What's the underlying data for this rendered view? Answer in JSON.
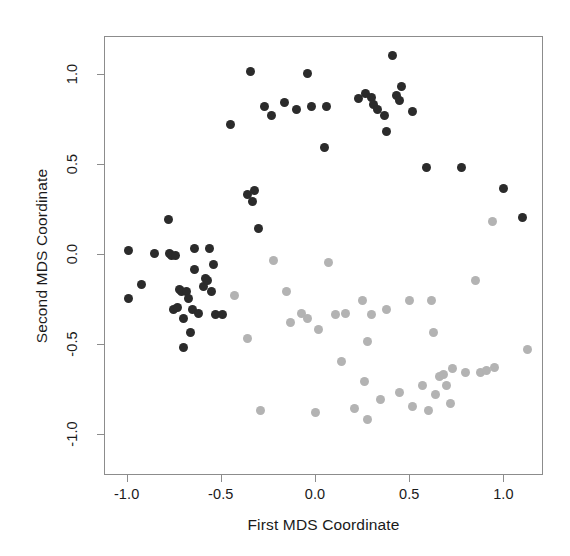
{
  "chart_data": {
    "type": "scatter",
    "title": "",
    "xlabel": "First MDS Coordinate",
    "ylabel": "Second MDS Coordinate",
    "xlim": [
      -1.12,
      1.21
    ],
    "ylim": [
      -1.23,
      1.21
    ],
    "xticks": [
      -1.0,
      -0.5,
      0.0,
      0.5,
      1.0
    ],
    "xticklabels": [
      "-1.0",
      "-0.5",
      "0.0",
      "0.5",
      "1.0"
    ],
    "yticks": [
      -1.0,
      -0.5,
      0.0,
      0.5,
      1.0
    ],
    "yticklabels": [
      "-1.0",
      "-0.5",
      "0.0",
      "0.5",
      "1.0"
    ],
    "grid": false,
    "legend": "none",
    "marker": "filled-circle",
    "marker_size_px": 9,
    "series": [
      {
        "name": "group-dark",
        "color": "#2b2b2b",
        "points": [
          [
            -0.99,
            0.02
          ],
          [
            -0.99,
            -0.25
          ],
          [
            -0.92,
            -0.17
          ],
          [
            -0.85,
            0.0
          ],
          [
            -0.78,
            0.19
          ],
          [
            -0.77,
            0.0
          ],
          [
            -0.76,
            -0.01
          ],
          [
            -0.75,
            -0.31
          ],
          [
            -0.74,
            -0.01
          ],
          [
            -0.73,
            -0.3
          ],
          [
            -0.72,
            -0.2
          ],
          [
            -0.71,
            -0.21
          ],
          [
            -0.7,
            -0.36
          ],
          [
            -0.7,
            -0.52
          ],
          [
            -0.68,
            -0.21
          ],
          [
            -0.67,
            -0.25
          ],
          [
            -0.66,
            -0.44
          ],
          [
            -0.65,
            -0.31
          ],
          [
            -0.64,
            -0.09
          ],
          [
            -0.64,
            0.03
          ],
          [
            -0.62,
            -0.33
          ],
          [
            -0.59,
            -0.18
          ],
          [
            -0.58,
            -0.14
          ],
          [
            -0.57,
            -0.15
          ],
          [
            -0.56,
            0.03
          ],
          [
            -0.55,
            -0.21
          ],
          [
            -0.54,
            -0.06
          ],
          [
            -0.53,
            -0.34
          ],
          [
            -0.49,
            -0.34
          ],
          [
            -0.45,
            0.72
          ],
          [
            -0.36,
            0.33
          ],
          [
            -0.34,
            1.01
          ],
          [
            -0.33,
            0.29
          ],
          [
            -0.32,
            0.35
          ],
          [
            -0.3,
            0.14
          ],
          [
            -0.27,
            0.82
          ],
          [
            -0.23,
            0.77
          ],
          [
            -0.16,
            0.84
          ],
          [
            -0.1,
            0.8
          ],
          [
            -0.04,
            1.0
          ],
          [
            -0.02,
            0.82
          ],
          [
            0.05,
            0.59
          ],
          [
            0.06,
            0.82
          ],
          [
            0.23,
            0.86
          ],
          [
            0.27,
            0.89
          ],
          [
            0.3,
            0.87
          ],
          [
            0.31,
            0.83
          ],
          [
            0.33,
            0.8
          ],
          [
            0.37,
            0.77
          ],
          [
            0.38,
            0.68
          ],
          [
            0.41,
            1.1
          ],
          [
            0.43,
            0.88
          ],
          [
            0.45,
            0.85
          ],
          [
            0.46,
            0.93
          ],
          [
            0.52,
            0.79
          ],
          [
            0.59,
            0.48
          ],
          [
            0.78,
            0.48
          ],
          [
            1.0,
            0.36
          ],
          [
            1.1,
            0.2
          ]
        ]
      },
      {
        "name": "group-light",
        "color": "#b3b3b3",
        "points": [
          [
            -0.43,
            -0.23
          ],
          [
            -0.36,
            -0.47
          ],
          [
            -0.29,
            -0.87
          ],
          [
            -0.22,
            -0.04
          ],
          [
            -0.15,
            -0.21
          ],
          [
            -0.13,
            -0.38
          ],
          [
            -0.07,
            -0.33
          ],
          [
            -0.04,
            -0.36
          ],
          [
            0.0,
            -0.88
          ],
          [
            0.02,
            -0.42
          ],
          [
            0.07,
            -0.05
          ],
          [
            0.11,
            -0.34
          ],
          [
            0.14,
            -0.6
          ],
          [
            0.16,
            -0.33
          ],
          [
            0.21,
            -0.86
          ],
          [
            0.25,
            -0.26
          ],
          [
            0.26,
            -0.71
          ],
          [
            0.28,
            -0.49
          ],
          [
            0.28,
            -0.92
          ],
          [
            0.3,
            -0.34
          ],
          [
            0.35,
            -0.81
          ],
          [
            0.38,
            -0.31
          ],
          [
            0.45,
            -0.77
          ],
          [
            0.5,
            -0.26
          ],
          [
            0.52,
            -0.85
          ],
          [
            0.57,
            -0.73
          ],
          [
            0.6,
            -0.87
          ],
          [
            0.62,
            -0.26
          ],
          [
            0.63,
            -0.44
          ],
          [
            0.64,
            -0.78
          ],
          [
            0.66,
            -0.68
          ],
          [
            0.68,
            -0.67
          ],
          [
            0.7,
            -0.73
          ],
          [
            0.72,
            -0.83
          ],
          [
            0.73,
            -0.64
          ],
          [
            0.8,
            -0.66
          ],
          [
            0.85,
            -0.15
          ],
          [
            0.88,
            -0.66
          ],
          [
            0.91,
            -0.65
          ],
          [
            0.94,
            0.18
          ],
          [
            0.95,
            -0.63
          ],
          [
            1.13,
            -0.53
          ]
        ]
      }
    ]
  },
  "axes": {
    "xlabel": "First MDS Coordinate",
    "ylabel": "Second MDS Coordinate"
  }
}
